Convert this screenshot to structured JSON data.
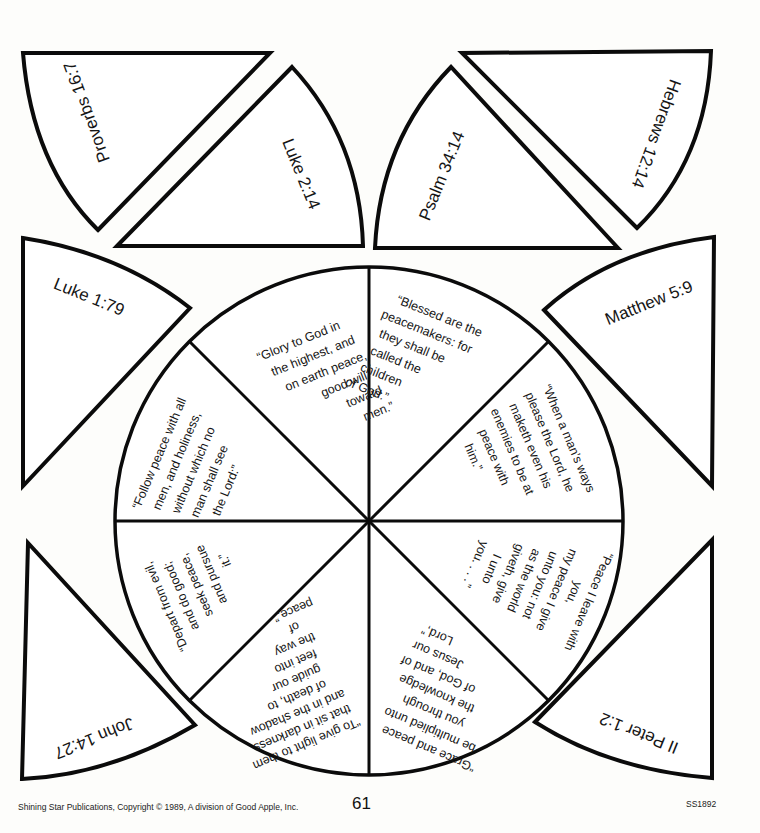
{
  "worksheet": {
    "outer_pieces": [
      {
        "id": "top-left-outer",
        "reference": "Proverbs 16:7"
      },
      {
        "id": "top-left-inner",
        "reference": "Luke 2:14"
      },
      {
        "id": "top-right-inner",
        "reference": "Psalm 34:14"
      },
      {
        "id": "top-right-outer",
        "reference": "Hebrews 12:14"
      },
      {
        "id": "left-upper",
        "reference": "Luke 1:79"
      },
      {
        "id": "right-upper",
        "reference": "Matthew 5:9"
      },
      {
        "id": "left-lower",
        "reference": "John 14:27"
      },
      {
        "id": "right-lower",
        "reference": "II Peter 1:2"
      }
    ],
    "wheel_sections": [
      {
        "id": "upper-left",
        "lines": [
          "“Glory to God in",
          "the highest, and",
          "on earth peace,",
          "good will",
          "toward",
          "men.”"
        ]
      },
      {
        "id": "upper-right",
        "lines": [
          "“Blessed are the",
          "peacemakers: for",
          "they shall be",
          "called the",
          "children",
          "of God.”"
        ]
      },
      {
        "id": "right-upper",
        "lines": [
          "“When a man’s ways",
          "please the Lord, he",
          "maketh even his",
          "enemies to be at",
          "peace with",
          "him.”"
        ]
      },
      {
        "id": "right-lower",
        "lines": [
          "“Peace  I  leave  with",
          "you,",
          "my peace I give",
          "unto you: not",
          "as the world",
          "giveth, give",
          "I unto",
          "you. . . .”"
        ]
      },
      {
        "id": "lower-right",
        "lines": [
          "“Grace and peace",
          "be multiplied unto",
          "you through",
          "the knowledge",
          "of God, and of",
          "Jesus our",
          "Lord,”"
        ]
      },
      {
        "id": "lower-left",
        "lines": [
          "“To give light to them",
          "that sit in darkness",
          "and in the shadow",
          "of death, to",
          "guide our",
          "feet into",
          "the way",
          "of",
          "peace.”"
        ]
      },
      {
        "id": "left-lower",
        "lines": [
          "“Depart from evil,",
          "and do good;",
          "seek peace,",
          "and pursue",
          "it.”"
        ]
      },
      {
        "id": "left-upper",
        "lines": [
          "“Follow peace with all",
          "men, and holiness,",
          "without which no",
          "man shall see",
          "the Lord:”"
        ]
      }
    ]
  },
  "footer": {
    "publisher": "Shining Star Publications, Copyright © 1989, A division of Good Apple, Inc.",
    "page_number": "61",
    "code": "SS1892"
  }
}
